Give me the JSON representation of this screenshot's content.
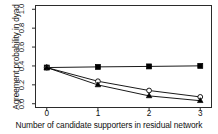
{
  "chart_data": {
    "type": "line",
    "title": "",
    "xlabel": "Number of candidate supporters in residual network",
    "ylabel": "Agreement probability in dyad",
    "x": [
      0,
      1,
      2,
      3
    ],
    "xticklabels": [
      "0",
      "1",
      "2",
      "3"
    ],
    "yticklabels": [
      "0.0",
      "0.2",
      "0.4",
      "0.6",
      "0.8",
      "1.0"
    ],
    "yticks": [
      0.0,
      0.2,
      0.4,
      0.6,
      0.8,
      1.0
    ],
    "xlim": [
      -0.22,
      3.22
    ],
    "ylim": [
      -0.04,
      1.04
    ],
    "grid": false,
    "legend": "none",
    "series": [
      {
        "name": "filled-square",
        "marker": "filled-square",
        "color": "#000000",
        "values": [
          0.383,
          0.39,
          0.395,
          0.401
        ]
      },
      {
        "name": "open-circle",
        "marker": "open-circle",
        "color": "#000000",
        "values": [
          0.383,
          0.238,
          0.14,
          0.072
        ]
      },
      {
        "name": "filled-triangle",
        "marker": "filled-triangle",
        "color": "#000000",
        "values": [
          0.383,
          0.199,
          0.083,
          0.032
        ]
      }
    ]
  }
}
